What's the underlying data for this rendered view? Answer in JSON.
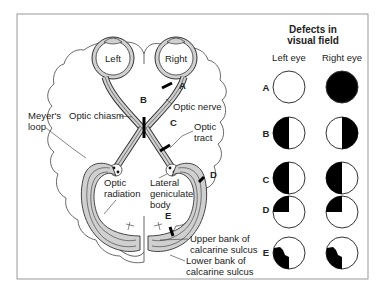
{
  "diagram": {
    "eyes": {
      "left": "Left",
      "right": "Right"
    },
    "anatomy_labels": {
      "meyers_loop_1": "Meyer's",
      "meyers_loop_2": "loop",
      "optic_chiasm": "Optic chiasm",
      "optic_nerve": "Optic nerve",
      "optic_tract_1": "Optic",
      "optic_tract_2": "tract",
      "optic_radiation_1": "Optic",
      "optic_radiation_2": "radiation",
      "lgb_1": "Lateral",
      "lgb_2": "geniculate",
      "lgb_3": "body",
      "upper_bank_1": "Upper bank of",
      "upper_bank_2": "calcarine sulcus",
      "lower_bank_1": "Lower bank of",
      "lower_bank_2": "calcarine sulcus"
    },
    "lesion_markers": [
      "A",
      "B",
      "C",
      "D",
      "E"
    ],
    "defects_panel": {
      "title_line1": "Defects in",
      "title_line2": "visual field",
      "col_left": "Left eye",
      "col_right": "Right eye",
      "rows": [
        {
          "label": "A",
          "left": "normal",
          "right": "complete blindness"
        },
        {
          "label": "B",
          "left": "temporal hemianopia",
          "right": "temporal hemianopia"
        },
        {
          "label": "C",
          "left": "left homonymous hemianopia",
          "right": "left homonymous hemianopia"
        },
        {
          "label": "D",
          "left": "upper left quadrantanopia",
          "right": "upper left quadrantanopia"
        },
        {
          "label": "E",
          "left": "lower left quadrant defect",
          "right": "lower left quadrant defect"
        }
      ]
    },
    "colors": {
      "tract_fill": "#d0d0d0",
      "stroke": "#333333",
      "defect": "#000000",
      "frame": "#999999"
    }
  }
}
